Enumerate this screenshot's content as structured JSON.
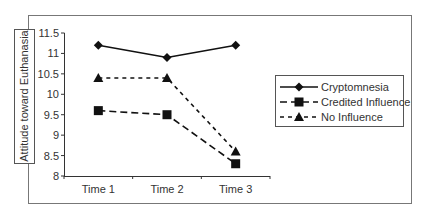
{
  "chart_data": {
    "type": "line",
    "title": "",
    "xlabel": "",
    "ylabel": "Attitude toward Euthanasia",
    "categories": [
      "Time 1",
      "Time 2",
      "Time 3"
    ],
    "ylim": [
      8,
      11.5
    ],
    "yticks": [
      "11.5",
      "11",
      "10.5",
      "10",
      "9.5",
      "9",
      "8.5",
      "8"
    ],
    "grid": false,
    "legend_position": "right",
    "series": [
      {
        "name": "Cryptomnesia",
        "marker": "diamond",
        "line": "solid",
        "values": [
          11.2,
          10.9,
          11.2
        ]
      },
      {
        "name": "Credited Influence",
        "marker": "square",
        "line": "long-dash",
        "values": [
          9.6,
          9.5,
          8.3
        ]
      },
      {
        "name": "No Influence",
        "marker": "triangle",
        "line": "short-dash",
        "values": [
          10.4,
          10.4,
          8.6
        ]
      }
    ]
  },
  "colors": {
    "line": "#111111",
    "frame": "#777777",
    "text": "#333333"
  }
}
